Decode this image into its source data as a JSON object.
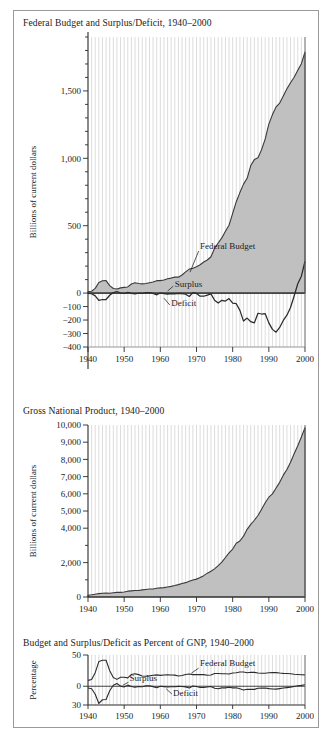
{
  "figure": {
    "panel_count": 3
  },
  "charts": [
    {
      "id": "federal-budget",
      "title": "Federal Budget and Surplus/Deficit, 1940–2000",
      "ylabel": "Billions of current dollars",
      "xlabel": "",
      "xticks": [
        "1940",
        "1950",
        "1960",
        "1970",
        "1980",
        "1990",
        "2000"
      ],
      "yticks": [
        "−400",
        "−300",
        "−200",
        "−100",
        "0",
        "500",
        "1,000",
        "1,500"
      ],
      "annotations": [
        "Federal Budget",
        "Surplus",
        "Deficit"
      ]
    },
    {
      "id": "gross-national-product",
      "title": "Gross National Product, 1940–2000",
      "ylabel": "Billions of current dollars",
      "xlabel": "",
      "xticks": [
        "1940",
        "1950",
        "1960",
        "1970",
        "1980",
        "1990",
        "2000"
      ],
      "yticks": [
        "0",
        "2,000",
        "4,000",
        "5,000",
        "6,000",
        "7,000",
        "8,000",
        "9,000",
        "10,000"
      ],
      "annotations": []
    },
    {
      "id": "percent-of-gnp",
      "title": "Budget and Surplus/Deficit as Percent of GNP, 1940–2000",
      "ylabel": "Percentage",
      "xlabel": "",
      "xticks": [
        "1940",
        "1950",
        "1960",
        "1970",
        "1980",
        "1990",
        "2000"
      ],
      "yticks": [
        "50",
        "0",
        "30"
      ],
      "annotations": [
        "Federal Budget",
        "Surplus",
        "Deficit"
      ]
    }
  ],
  "chart_data": [
    {
      "type": "area",
      "id": "federal-budget",
      "title": "Federal Budget and Surplus/Deficit, 1940–2000",
      "xlabel": "",
      "ylabel": "Billions of current dollars",
      "xlim": [
        1940,
        2000
      ],
      "ylim": [
        -400,
        1900
      ],
      "ytick_step": 100,
      "ytick_labeled": [
        -400,
        -300,
        -200,
        -100,
        0,
        500,
        1000,
        1500
      ],
      "xtick_labeled": [
        1940,
        1950,
        1960,
        1970,
        1980,
        1990,
        2000
      ],
      "grid": "vertical-yearly",
      "legend": "inline-annotation",
      "x": [
        1940,
        1941,
        1942,
        1943,
        1944,
        1945,
        1946,
        1947,
        1948,
        1949,
        1950,
        1951,
        1952,
        1953,
        1954,
        1955,
        1956,
        1957,
        1958,
        1959,
        1960,
        1961,
        1962,
        1963,
        1964,
        1965,
        1966,
        1967,
        1968,
        1969,
        1970,
        1971,
        1972,
        1973,
        1974,
        1975,
        1976,
        1977,
        1978,
        1979,
        1980,
        1981,
        1982,
        1983,
        1984,
        1985,
        1986,
        1987,
        1988,
        1989,
        1990,
        1991,
        1992,
        1993,
        1994,
        1995,
        1996,
        1997,
        1998,
        1999,
        2000
      ],
      "series": [
        {
          "name": "Federal Budget",
          "fill": "#b8b8b8",
          "values": [
            9.5,
            13.7,
            35.1,
            78.6,
            91.3,
            92.7,
            55.2,
            34.5,
            29.8,
            38.8,
            42.6,
            45.5,
            67.7,
            76.1,
            70.9,
            68.4,
            70.6,
            76.6,
            82.4,
            92.1,
            92.2,
            97.7,
            106.8,
            111.3,
            118.5,
            118.2,
            134.5,
            157.5,
            178.1,
            183.6,
            195.6,
            210.2,
            230.7,
            245.7,
            269.4,
            332.3,
            371.8,
            409.2,
            458.7,
            504.0,
            590.9,
            678.2,
            745.7,
            808.4,
            851.8,
            946.4,
            990.3,
            1004.0,
            1064.4,
            1143.7,
            1253.2,
            1324.4,
            1381.5,
            1409.4,
            1461.7,
            1515.7,
            1560.5,
            1601.1,
            1652.5,
            1701.8,
            1788.8
          ]
        },
        {
          "name": "Surplus/Deficit",
          "fill": "none",
          "values": [
            -2.9,
            -4.9,
            -20.5,
            -54.6,
            -47.6,
            -47.6,
            -15.9,
            4.0,
            11.8,
            0.6,
            -3.1,
            6.1,
            -1.5,
            -6.5,
            -1.2,
            -3.0,
            3.9,
            3.4,
            -2.8,
            -12.8,
            0.3,
            -3.3,
            -7.1,
            -4.8,
            -5.9,
            -1.4,
            -3.7,
            -8.6,
            -25.2,
            3.2,
            -2.8,
            -23.0,
            -23.4,
            -14.9,
            -6.1,
            -53.2,
            -73.7,
            -53.7,
            -59.2,
            -40.7,
            -73.8,
            -79.0,
            -128.0,
            -207.8,
            -185.4,
            -212.3,
            -221.2,
            -149.7,
            -155.2,
            -152.6,
            -221.0,
            -269.2,
            -290.3,
            -255.1,
            -203.2,
            -164.0,
            -107.4,
            -21.9,
            69.3,
            125.6,
            236.2
          ]
        }
      ],
      "annotations": [
        {
          "text": "Federal Budget",
          "x": 1971,
          "y": 330
        },
        {
          "text": "Surplus",
          "x": 1964,
          "y": 45
        },
        {
          "text": "Deficit",
          "x": 1963,
          "y": -90
        }
      ]
    },
    {
      "type": "area",
      "id": "gross-national-product",
      "title": "Gross National Product, 1940–2000",
      "xlabel": "",
      "ylabel": "Billions of current dollars",
      "xlim": [
        1940,
        2000
      ],
      "ylim": [
        0,
        10000
      ],
      "ytick_step": 1000,
      "ytick_labeled": [
        0,
        2000,
        4000,
        5000,
        6000,
        7000,
        8000,
        9000,
        10000
      ],
      "xtick_labeled": [
        1940,
        1950,
        1960,
        1970,
        1980,
        1990,
        2000
      ],
      "grid": "vertical-yearly",
      "legend": "none",
      "x": [
        1940,
        1941,
        1942,
        1943,
        1944,
        1945,
        1946,
        1947,
        1948,
        1949,
        1950,
        1951,
        1952,
        1953,
        1954,
        1955,
        1956,
        1957,
        1958,
        1959,
        1960,
        1961,
        1962,
        1963,
        1964,
        1965,
        1966,
        1967,
        1968,
        1969,
        1970,
        1971,
        1972,
        1973,
        1974,
        1975,
        1976,
        1977,
        1978,
        1979,
        1980,
        1981,
        1982,
        1983,
        1984,
        1985,
        1986,
        1987,
        1988,
        1989,
        1990,
        1991,
        1992,
        1993,
        1994,
        1995,
        1996,
        1997,
        1998,
        1999,
        2000
      ],
      "series": [
        {
          "name": "Gross National Product",
          "fill": "#b8b8b8",
          "values": [
            101,
            127,
            162,
            199,
            220,
            223,
            222,
            244,
            270,
            267,
            294,
            339,
            358,
            379,
            381,
            415,
            438,
            461,
            467,
            507,
            529,
            546,
            586,
            618,
            664,
            720,
            788,
            834,
            911,
            985,
            1039,
            1128,
            1241,
            1386,
            1501,
            1635,
            1824,
            2031,
            2296,
            2563,
            2790,
            3128,
            3255,
            3537,
            3933,
            4220,
            4463,
            4739,
            5104,
            5484,
            5803,
            5996,
            6338,
            6667,
            7085,
            7415,
            7839,
            8332,
            8794,
            9299,
            9849
          ]
        }
      ],
      "annotations": []
    },
    {
      "type": "line",
      "id": "percent-of-gnp",
      "title": "Budget and Surplus/Deficit as Percent of GNP, 1940–2000",
      "xlabel": "",
      "ylabel": "Percentage",
      "xlim": [
        1940,
        2000
      ],
      "ylim": [
        -30,
        50
      ],
      "ytick_labeled": [
        50,
        0,
        -30
      ],
      "xtick_labeled": [
        1940,
        1950,
        1960,
        1970,
        1980,
        1990,
        2000
      ],
      "grid": "vertical-yearly",
      "legend": "inline-annotation",
      "x": [
        1940,
        1941,
        1942,
        1943,
        1944,
        1945,
        1946,
        1947,
        1948,
        1949,
        1950,
        1951,
        1952,
        1953,
        1954,
        1955,
        1956,
        1957,
        1958,
        1959,
        1960,
        1961,
        1962,
        1963,
        1964,
        1965,
        1966,
        1967,
        1968,
        1969,
        1970,
        1971,
        1972,
        1973,
        1974,
        1975,
        1976,
        1977,
        1978,
        1979,
        1980,
        1981,
        1982,
        1983,
        1984,
        1985,
        1986,
        1987,
        1988,
        1989,
        1990,
        1991,
        1992,
        1993,
        1994,
        1995,
        1996,
        1997,
        1998,
        1999,
        2000
      ],
      "series": [
        {
          "name": "Federal Budget",
          "values": [
            9.4,
            10.8,
            21.7,
            39.5,
            41.5,
            41.6,
            24.9,
            14.1,
            11.0,
            14.5,
            14.5,
            13.4,
            18.9,
            20.1,
            18.6,
            16.5,
            16.1,
            16.6,
            17.6,
            18.2,
            17.4,
            17.9,
            18.2,
            18.0,
            17.8,
            16.4,
            17.1,
            18.9,
            19.6,
            18.6,
            18.8,
            18.6,
            18.6,
            17.7,
            17.9,
            20.3,
            20.4,
            20.1,
            20.0,
            19.7,
            21.2,
            21.7,
            22.9,
            22.9,
            21.7,
            22.4,
            22.2,
            21.2,
            20.9,
            20.9,
            21.6,
            22.1,
            21.8,
            21.1,
            20.6,
            20.4,
            19.9,
            19.2,
            18.8,
            18.3,
            18.2
          ]
        },
        {
          "name": "Surplus/Deficit",
          "values": [
            -2.9,
            -3.9,
            -12.7,
            -27.5,
            -21.6,
            -21.3,
            -7.2,
            1.6,
            4.4,
            0.2,
            -1.1,
            1.8,
            -0.4,
            -1.7,
            -0.3,
            -0.7,
            0.9,
            0.7,
            -0.6,
            -2.5,
            0.1,
            -0.6,
            -1.2,
            -0.8,
            -0.9,
            -0.2,
            -0.5,
            -1.0,
            -2.8,
            0.3,
            -0.3,
            -2.0,
            -1.9,
            -1.1,
            -0.4,
            -3.3,
            -4.0,
            -2.6,
            -2.6,
            -1.6,
            -2.6,
            -2.5,
            -3.9,
            -5.9,
            -4.7,
            -5.0,
            -5.0,
            -3.2,
            -3.0,
            -2.8,
            -3.8,
            -4.5,
            -4.6,
            -3.8,
            -2.9,
            -2.2,
            -1.4,
            -0.3,
            0.8,
            1.4,
            2.4
          ]
        }
      ],
      "annotations": [
        {
          "text": "Federal Budget",
          "x": 1972,
          "y": 31
        },
        {
          "text": "Surplus",
          "x": 1953,
          "y": 8
        },
        {
          "text": "Deficit",
          "x": 1964,
          "y": -12
        }
      ]
    }
  ]
}
